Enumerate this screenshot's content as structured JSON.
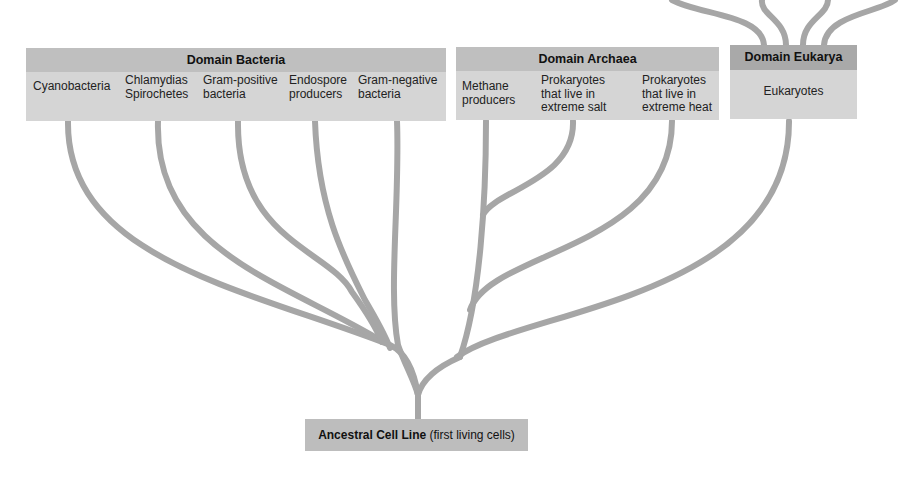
{
  "diagram": {
    "colors": {
      "branch": "#a6a6a6",
      "header": "#bfbfbf",
      "header_eukarya": "#a9a9a9",
      "box": "#d5d5d5"
    }
  },
  "domains": [
    {
      "name": "Domain Bacteria",
      "groups": [
        {
          "lines": [
            "Cyanobacteria"
          ]
        },
        {
          "lines": [
            "Chlamydias",
            "Spirochetes"
          ]
        },
        {
          "lines": [
            "Gram-positive",
            "bacteria"
          ]
        },
        {
          "lines": [
            "Endospore",
            "producers"
          ]
        },
        {
          "lines": [
            "Gram-negative",
            "bacteria"
          ]
        }
      ]
    },
    {
      "name": "Domain Archaea",
      "groups": [
        {
          "lines": [
            "Methane",
            "producers"
          ]
        },
        {
          "lines": [
            "Prokaryotes",
            "that live in",
            "extreme salt"
          ]
        },
        {
          "lines": [
            "Prokaryotes",
            "that live in",
            "extreme heat"
          ]
        }
      ]
    },
    {
      "name": "Domain Eukarya",
      "groups": [
        {
          "lines": [
            "Eukaryotes"
          ]
        }
      ]
    }
  ],
  "root": {
    "label_bold": "Ancestral Cell Line",
    "label_rest": " (first living cells)"
  }
}
